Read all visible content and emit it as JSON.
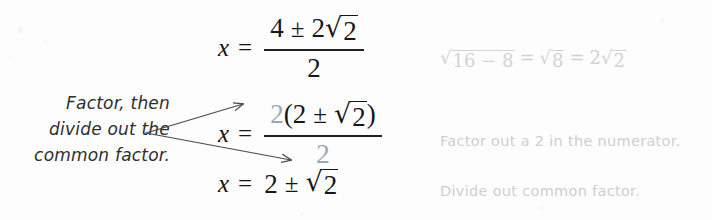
{
  "page": {
    "background_color": "#fdfdfd",
    "ink_color": "#161616",
    "highlight_color": "#9aa7b4",
    "margin_note_color": "#cfcfcf"
  },
  "callout": {
    "line1": "Factor, then",
    "line2": "divide out the",
    "line3": "common factor.",
    "arrow_count": 2,
    "arrow_targets": [
      "numerator-factor-2",
      "denominator-2"
    ]
  },
  "steps": [
    {
      "id": "step-1",
      "lhs": "x",
      "relation": "=",
      "numerator": {
        "first": "4",
        "operator": "±",
        "coefficient": "2",
        "radicand": "2"
      },
      "denominator": "2",
      "margin_note": {
        "kind": "math",
        "radicand_1": "16 − 8",
        "equals_1": "=",
        "radicand_2": "8",
        "equals_2": "=",
        "coefficient": "2",
        "radicand_3": "2"
      }
    },
    {
      "id": "step-2",
      "lhs": "x",
      "relation": "=",
      "numerator": {
        "factor": "2",
        "open_paren": "(",
        "first": "2",
        "operator": "±",
        "radicand": "2",
        "close_paren": ")"
      },
      "denominator": "2",
      "margin_note": {
        "kind": "text",
        "text": "Factor out a 2 in the numerator."
      }
    },
    {
      "id": "step-3",
      "lhs": "x",
      "relation": "=",
      "result": {
        "first": "2",
        "operator": "±",
        "radicand": "2"
      },
      "margin_note": {
        "kind": "text",
        "text": "Divide out common factor."
      }
    }
  ],
  "glyphs": {
    "radical_sign": "√",
    "plus_minus": "±",
    "equals": "="
  }
}
